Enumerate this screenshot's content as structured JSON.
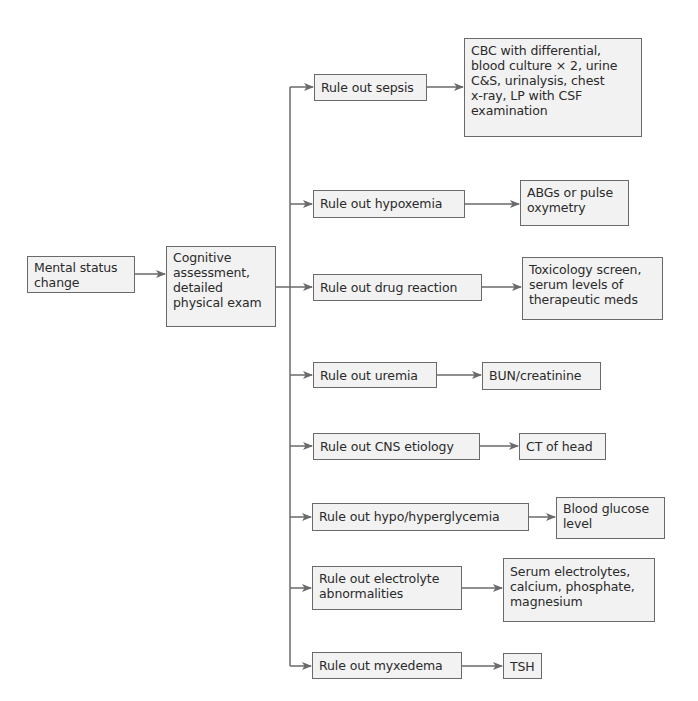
{
  "diagram": {
    "type": "flowchart",
    "direction": "left-to-right",
    "colors": {
      "box_fill": "#f2f2f2",
      "box_border": "#6a6a6a",
      "line": "#6a6a6a",
      "text": "#2a2a2a"
    },
    "start": {
      "label": "Mental status\nchange"
    },
    "assessment": {
      "label": "Cognitive\nassessment,\ndetailed\nphysical exam"
    },
    "branches": [
      {
        "rule_out": "Rule out sepsis",
        "tests": "CBC with differential,\nblood culture × 2, urine\nC&S, urinalysis, chest\nx-ray, LP with CSF\nexamination"
      },
      {
        "rule_out": "Rule out hypoxemia",
        "tests": "ABGs or pulse\noxymetry"
      },
      {
        "rule_out": "Rule out drug reaction",
        "tests": "Toxicology screen,\nserum levels of\ntherapeutic meds"
      },
      {
        "rule_out": "Rule out uremia",
        "tests": "BUN/creatinine"
      },
      {
        "rule_out": "Rule out CNS etiology",
        "tests": "CT of head"
      },
      {
        "rule_out": "Rule out hypo/hyperglycemia",
        "tests": "Blood glucose\nlevel"
      },
      {
        "rule_out": "Rule out electrolyte\nabnormalities",
        "tests": "Serum electrolytes,\ncalcium, phosphate,\nmagnesium"
      },
      {
        "rule_out": "Rule out myxedema",
        "tests": "TSH"
      }
    ]
  }
}
